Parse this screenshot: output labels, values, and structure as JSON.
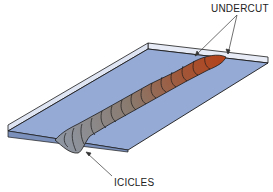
{
  "diagram": {
    "labels": {
      "undercut": "UNDERCUT",
      "icicles": "ICICLES"
    },
    "colors": {
      "plate_top": "#93a9d4",
      "plate_edge": "#e4e9f4",
      "outline": "#1a1a1a",
      "bead_start": "#8d97a4",
      "bead_end": "#b3441b",
      "background": "#ffffff"
    },
    "annotations": [
      {
        "label": "UNDERCUT",
        "points_to": [
          "left undercut at bead end",
          "right undercut at bead end"
        ]
      },
      {
        "label": "ICICLES",
        "points_to": [
          "bead start underside"
        ]
      }
    ]
  }
}
